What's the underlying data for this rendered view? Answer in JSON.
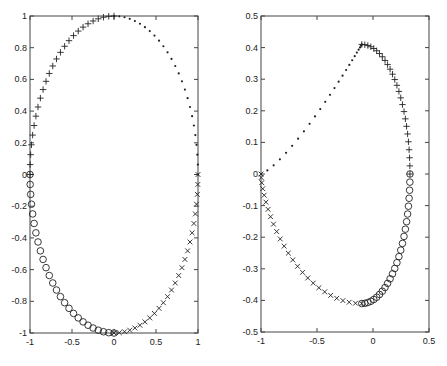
{
  "chart_data": [
    {
      "type": "scatter",
      "title": "",
      "xlabel": "",
      "ylabel": "",
      "xlim": [
        -1,
        1
      ],
      "ylim": [
        -1,
        1
      ],
      "xticks": [
        -1,
        -0.5,
        0,
        0.5,
        1
      ],
      "xtick_labels": [
        "-1",
        "-0.5",
        "0",
        "0.5",
        "1"
      ],
      "yticks": [
        -1,
        -0.8,
        -0.6,
        -0.4,
        -0.2,
        0,
        0.2,
        0.4,
        0.6,
        0.8,
        1
      ],
      "ytick_labels": [
        "-1",
        "-0.8",
        "-0.6",
        "-0.4",
        "-0.2",
        "0",
        "0.2",
        "0.4",
        "0.6",
        "0.8",
        "1"
      ],
      "grid": false,
      "legend": null,
      "description": "Unit circle sampled in four quadrants with different markers",
      "series": [
        {
          "name": "quadrant-1",
          "marker": "dot",
          "param": "circle",
          "t_start": 0,
          "t_end": 90,
          "n": 26
        },
        {
          "name": "quadrant-2",
          "marker": "plus",
          "param": "circle",
          "t_start": 90,
          "t_end": 180,
          "n": 26
        },
        {
          "name": "quadrant-3",
          "marker": "circle",
          "param": "circle",
          "t_start": 180,
          "t_end": 270,
          "n": 26
        },
        {
          "name": "quadrant-4",
          "marker": "x",
          "param": "circle",
          "t_start": 270,
          "t_end": 360,
          "n": 26
        }
      ]
    },
    {
      "type": "scatter",
      "title": "",
      "xlabel": "",
      "ylabel": "",
      "xlim": [
        -1,
        0.5
      ],
      "ylim": [
        -0.5,
        0.5
      ],
      "xticks": [
        -1,
        -0.5,
        0,
        0.5
      ],
      "xtick_labels": [
        "-1",
        "-0.5",
        "0",
        "0.5"
      ],
      "yticks": [
        -0.5,
        -0.4,
        -0.3,
        -0.2,
        -0.1,
        0,
        0.1,
        0.2,
        0.3,
        0.4,
        0.5
      ],
      "ytick_labels": [
        "-0.5",
        "-0.4",
        "-0.3",
        "-0.2",
        "-0.1",
        "0",
        "0.1",
        "0.2",
        "0.3",
        "0.4",
        "0.5"
      ],
      "grid": false,
      "legend": null,
      "description": "Image of the unit circle under a mapping; closed loop through (-1,0), peak near (-0.1,0.41), right extreme near (0.33,0), trough near (-0.1,-0.41)",
      "series": [
        {
          "name": "quadrant-1",
          "marker": "dot",
          "param": "map",
          "t_start": 0,
          "t_end": 90,
          "n": 26
        },
        {
          "name": "quadrant-2",
          "marker": "plus",
          "param": "map",
          "t_start": 90,
          "t_end": 180,
          "n": 26
        },
        {
          "name": "quadrant-3",
          "marker": "circle",
          "param": "map",
          "t_start": 180,
          "t_end": 270,
          "n": 26
        },
        {
          "name": "quadrant-4",
          "marker": "x",
          "param": "map",
          "t_start": 270,
          "t_end": 360,
          "n": 26
        }
      ],
      "key_points": [
        {
          "x": -1.0,
          "y": 0.0
        },
        {
          "x": -0.1,
          "y": 0.41
        },
        {
          "x": 0.33,
          "y": 0.0
        },
        {
          "x": -0.1,
          "y": -0.41
        }
      ]
    }
  ],
  "panels": [
    {
      "x0": 30,
      "y0": 16,
      "x1": 198,
      "y1": 333
    },
    {
      "x0": 261,
      "y0": 16,
      "x1": 429,
      "y1": 332
    }
  ]
}
